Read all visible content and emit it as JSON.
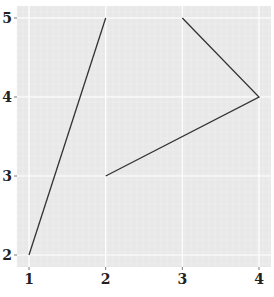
{
  "chart_data": {
    "type": "line",
    "title": "",
    "xlabel": "",
    "ylabel": "",
    "xlim": [
      1,
      4
    ],
    "ylim": [
      2,
      5
    ],
    "x_ticks": [
      "1",
      "2",
      "3",
      "4"
    ],
    "y_ticks": [
      "2",
      "3",
      "4",
      "5"
    ],
    "grid": true,
    "legend": null,
    "series": [
      {
        "name": "path",
        "segments": [
          [
            {
              "x": 1,
              "y": 2
            },
            {
              "x": 2,
              "y": 5
            }
          ],
          [
            {
              "x": 3,
              "y": 5
            },
            {
              "x": 4,
              "y": 4
            },
            {
              "x": 2,
              "y": 3
            }
          ]
        ]
      }
    ],
    "colors": {
      "panel_background": "#e8e8e8",
      "grid_major": "#ffffff",
      "line": "#333333"
    }
  }
}
